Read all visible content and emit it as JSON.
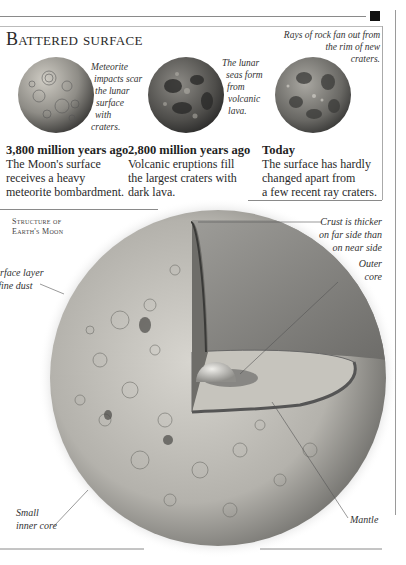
{
  "header": {
    "title": "Battered surface"
  },
  "phases": [
    {
      "image_icon": "moon-cratered-icon",
      "caption": [
        "Meteorite",
        "impacts scar",
        "the lunar",
        "surface",
        "with",
        "craters."
      ],
      "heading": "3,800 million years ago",
      "body": [
        "The Moon's surface",
        "receives a heavy",
        "meteorite bombardment."
      ]
    },
    {
      "image_icon": "moon-lava-seas-icon",
      "caption": [
        "The lunar",
        "seas form",
        "from",
        "volcanic",
        "lava."
      ],
      "heading": "2,800 million years ago",
      "body": [
        "Volcanic eruptions fill",
        "the largest craters with",
        "dark lava."
      ]
    },
    {
      "image_icon": "moon-today-icon",
      "caption": [
        "Rays of rock fan out from",
        "the rim of new",
        "craters."
      ],
      "heading": "Today",
      "body": [
        "The surface has hardly",
        "changed apart from",
        "a few recent ray craters."
      ]
    }
  ],
  "structure": {
    "title": [
      "Structure of",
      "Earth's Moon"
    ],
    "labels": {
      "crust": [
        "Crust is thicker",
        "on far side than",
        "on near side"
      ],
      "outer_core": [
        "Outer",
        "core"
      ],
      "surface_layer": [
        "Surface layer",
        "of fine dust"
      ],
      "inner_core": [
        "Small",
        "inner core"
      ],
      "mantle": [
        "Mantle"
      ]
    }
  },
  "colors": {
    "rule": "#8a8a8a",
    "marker": "#111111",
    "moon_light": "#d8d6d0",
    "moon_dark": "#5a5a58"
  }
}
